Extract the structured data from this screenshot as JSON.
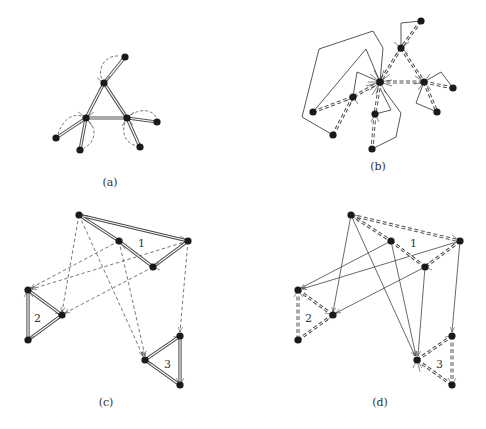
{
  "figure": {
    "panels": [
      {
        "id": "a",
        "caption": "(a)",
        "caption_pos": [
          110,
          185
        ]
      },
      {
        "id": "b",
        "caption": "(b)",
        "caption_pos": [
          378,
          168
        ]
      },
      {
        "id": "c",
        "caption": "(c)",
        "caption_pos": [
          106,
          404
        ]
      },
      {
        "id": "d",
        "caption": "(d)",
        "caption_pos": [
          380,
          404
        ]
      }
    ],
    "cluster_labels_c": [
      "1",
      "2",
      "3"
    ],
    "cluster_labels_d": [
      "1",
      "2",
      "3"
    ]
  },
  "colors": {
    "node": "#1a1a1a",
    "edge": "#444444",
    "background": "#ffffff"
  }
}
